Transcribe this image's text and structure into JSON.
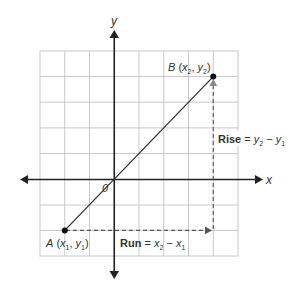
{
  "diagram": {
    "axes": {
      "x_label": "x",
      "y_label": "y",
      "origin_label": "0"
    },
    "grid": {
      "columns": 8,
      "rows": 8
    },
    "points": {
      "A": {
        "name": "A",
        "coord_label": "(x1, y1)",
        "x_var": "x",
        "x_sub": "1",
        "y_var": "y",
        "y_sub": "1"
      },
      "B": {
        "name": "B",
        "coord_label": "(x2, y2)",
        "x_var": "x",
        "x_sub": "2",
        "y_var": "y",
        "y_sub": "2"
      }
    },
    "rise": {
      "word": "Rise",
      "eq": "=",
      "a_var": "y",
      "a_sub": "2",
      "minus": "−",
      "b_var": "y",
      "b_sub": "1"
    },
    "run": {
      "word": "Run",
      "eq": "=",
      "a_var": "x",
      "a_sub": "2",
      "minus": "−",
      "b_var": "x",
      "b_sub": "1"
    },
    "colors": {
      "grid": "#c8c8c8",
      "axis": "#333333",
      "line": "#333333",
      "dashed": "#666666",
      "text": "#333333"
    }
  }
}
